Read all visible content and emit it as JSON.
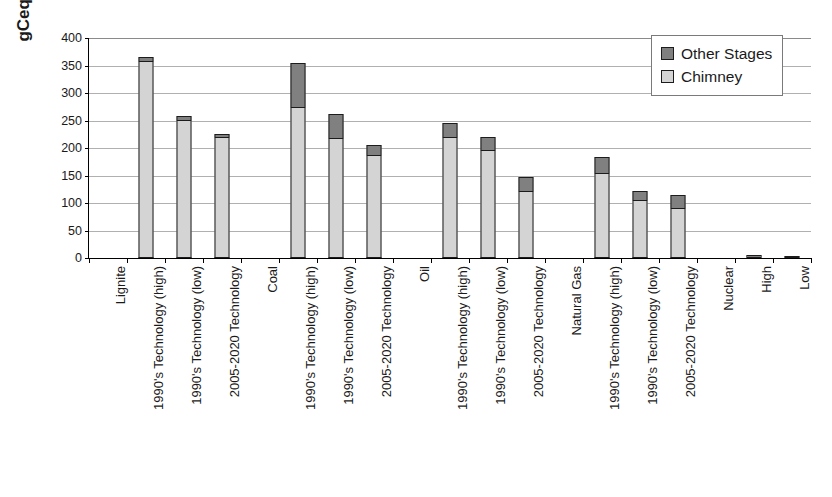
{
  "chart_data": {
    "type": "bar",
    "stacked": true,
    "title": "",
    "xlabel": "",
    "ylabel": "gCeq/kWh",
    "ylim": [
      0,
      400
    ],
    "yticks": [
      0,
      50,
      100,
      150,
      200,
      250,
      300,
      350,
      400
    ],
    "grid": true,
    "legend_position": "top-right",
    "legend": [
      "Other Stages",
      "Chimney"
    ],
    "colors": {
      "other_stages": "#808080",
      "chimney": "#d4d4d4",
      "outline": "#1c1c1c",
      "gridline": "#b0b0b0",
      "axis": "#000000"
    },
    "categories": [
      "Lignite",
      "1990's Technology (high)",
      "1990's Technology (low)",
      "2005-2020 Technology",
      "Coal",
      "1990's Technology (high)",
      "1990's Technology (low)",
      "2005-2020 Technology",
      "Oil",
      "1990's Technology (high)",
      "1990's Technology (low)",
      "2005-2020 Technology",
      "Natural Gas",
      "1990's Technology (high)",
      "1990's Technology (low)",
      "2005-2020 Technology",
      "Nuclear",
      "High",
      "Low"
    ],
    "series": [
      {
        "name": "Chimney",
        "values": [
          null,
          357,
          250,
          219,
          null,
          272,
          216,
          186,
          null,
          218,
          195,
          120,
          null,
          153,
          103,
          90,
          null,
          0,
          0
        ]
      },
      {
        "name": "Other Stages",
        "values": [
          null,
          8,
          9,
          7,
          null,
          83,
          46,
          19,
          null,
          27,
          25,
          28,
          null,
          31,
          18,
          25,
          null,
          5,
          2
        ]
      }
    ],
    "totals": [
      null,
      365,
      259,
      226,
      null,
      355,
      262,
      205,
      null,
      245,
      220,
      148,
      null,
      184,
      121,
      115,
      null,
      5,
      2
    ]
  }
}
